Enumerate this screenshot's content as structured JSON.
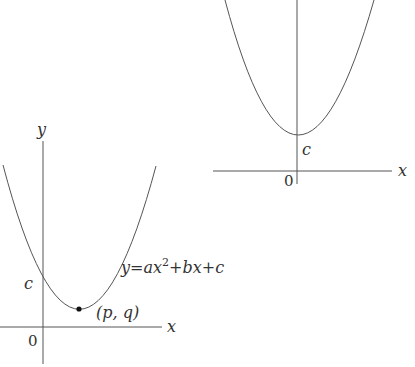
{
  "colors": {
    "stroke": "#555555",
    "text": "#333333",
    "point": "#111111"
  },
  "right_graph": {
    "description": "Parabola with vertex on the y-axis at (0, c)",
    "x_label": "x",
    "origin_label": "0",
    "intercept_label": "c"
  },
  "left_graph": {
    "description": "Parabola with vertex at (p, q) and y-intercept c",
    "x_label": "x",
    "y_label": "y",
    "origin_label": "0",
    "intercept_label": "c",
    "vertex_label": "(p, q)",
    "equation": {
      "lhs": "y",
      "eq": "=",
      "a": "a",
      "x1": "x",
      "exp": "2",
      "plus1": "+",
      "b": "b",
      "x2": "x",
      "plus2": "+",
      "c": "c"
    }
  }
}
